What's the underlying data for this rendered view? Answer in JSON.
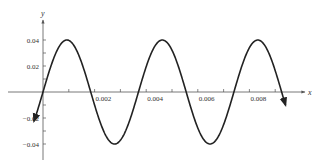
{
  "chart_data": {
    "type": "line",
    "title": "",
    "xlabel": "x",
    "ylabel": "y",
    "xlim": [
      -0.0016,
      0.0108
    ],
    "ylim": [
      -0.052,
      0.052
    ],
    "grid": false,
    "x_ticks": [
      0.001,
      0.002,
      0.003,
      0.004,
      0.005,
      0.006,
      0.007,
      0.008,
      0.009
    ],
    "x_tick_labels": [
      {
        "value": 0.002,
        "label": "0.002"
      },
      {
        "value": 0.004,
        "label": "0.004"
      },
      {
        "value": 0.006,
        "label": "0.006"
      },
      {
        "value": 0.008,
        "label": "0.008"
      }
    ],
    "y_ticks": [
      -0.04,
      -0.03,
      -0.02,
      -0.01,
      0.01,
      0.02,
      0.03,
      0.04
    ],
    "y_tick_labels": [
      {
        "value": 0.04,
        "label": "0.04"
      },
      {
        "value": 0.02,
        "label": "0.02"
      },
      {
        "value": -0.02,
        "label": "−0.02"
      },
      {
        "value": -0.04,
        "label": "−0.04"
      }
    ],
    "series": [
      {
        "name": "y = 0.04 sin(2π t / 0.0037)",
        "function": "sine",
        "amplitude": 0.04,
        "period": 0.0037,
        "phase": 0,
        "x_start": -0.00035,
        "x_end": 0.0094,
        "color": "#222222",
        "arrow_ends": true
      }
    ]
  }
}
